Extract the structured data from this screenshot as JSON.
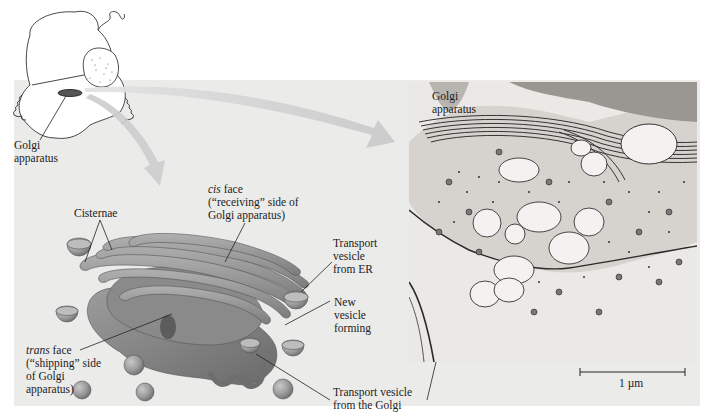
{
  "figure": {
    "subject": "Golgi apparatus",
    "cell_sketch": {
      "label": [
        "Golgi",
        "apparatus"
      ]
    },
    "illustration": {
      "labels": {
        "cisternae": "Cisternae",
        "cis_face": {
          "italic": "cis",
          "line1_rest": " face",
          "line2": "(“receiving” side of",
          "line3": "Golgi apparatus)"
        },
        "trans_face": {
          "italic": "trans",
          "line1_rest": " face",
          "line2": "(“shipping” side",
          "line3": "of Golgi",
          "line4": "apparatus)"
        },
        "transport_vesicle_er": [
          "Transport",
          "vesicle",
          "from ER"
        ],
        "new_vesicle": [
          "New",
          "vesicle",
          "forming"
        ],
        "transport_vesicle_golgi": [
          "Transport vesicle",
          "from the Golgi"
        ]
      }
    },
    "micrograph": {
      "label": [
        "Golgi",
        "apparatus"
      ],
      "scale_bar": "1 µm"
    },
    "colors": {
      "panel_bg": "#ebebea",
      "arrow": "#cfcfcf",
      "golgi_fill": "#8e8e8e",
      "golgi_light": "#b5b5b5",
      "leader_line": "#222222"
    }
  }
}
